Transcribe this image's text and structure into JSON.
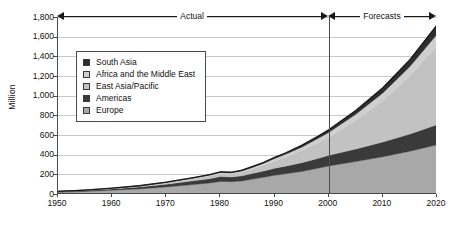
{
  "chart_data": {
    "type": "area",
    "stacked": true,
    "title": "",
    "xlabel": "",
    "ylabel": "Million",
    "xlim": [
      1950,
      2020
    ],
    "ylim": [
      0,
      1800
    ],
    "ytick_labels": [
      "0",
      "200",
      "400",
      "600",
      "800",
      "1,000",
      "1,200",
      "1,400",
      "1,600",
      "1,800"
    ],
    "ytick_values": [
      0,
      200,
      400,
      600,
      800,
      1000,
      1200,
      1400,
      1600,
      1800
    ],
    "xtick_labels": [
      "1950",
      "1960",
      "1970",
      "1980",
      "1990",
      "2000",
      "2010",
      "2020"
    ],
    "xtick_values": [
      1950,
      1960,
      1970,
      1980,
      1990,
      2000,
      2010,
      2020
    ],
    "grid": "horizontal",
    "legend_position": "upper-left-inside",
    "annotations": [
      {
        "label": "Actual",
        "from": 1950,
        "to": 2000,
        "style": "double-arrow"
      },
      {
        "label": "Forecasts",
        "from": 2000,
        "to": 2020,
        "style": "double-arrow"
      }
    ],
    "forecast_divider_x": 2000,
    "x": [
      1950,
      1955,
      1960,
      1965,
      1970,
      1975,
      1978,
      1980,
      1982,
      1984,
      1986,
      1988,
      1990,
      1992,
      1995,
      1998,
      2000,
      2005,
      2010,
      2015,
      2020
    ],
    "series": [
      {
        "name": "Europe",
        "color": "#a8a8a8",
        "values": [
          18,
          26,
          38,
          52,
          72,
          96,
          112,
          128,
          125,
          133,
          152,
          170,
          190,
          205,
          230,
          262,
          285,
          330,
          380,
          435,
          500
        ]
      },
      {
        "name": "Americas",
        "color": "#3a3a3a",
        "values": [
          7,
          10,
          14,
          20,
          28,
          38,
          44,
          50,
          48,
          52,
          58,
          64,
          72,
          78,
          88,
          100,
          108,
          128,
          150,
          175,
          205
        ]
      },
      {
        "name": "East Asia/Pacific",
        "color": "#c2c2c2",
        "values": [
          1,
          2,
          4,
          7,
          12,
          20,
          26,
          30,
          30,
          36,
          46,
          58,
          74,
          92,
          124,
          160,
          185,
          290,
          420,
          590,
          800
        ]
      },
      {
        "name": "Africa and the Middle East",
        "color": "#cfcfcf",
        "values": [
          1,
          1,
          2,
          3,
          5,
          8,
          10,
          12,
          12,
          14,
          17,
          20,
          24,
          28,
          34,
          42,
          48,
          62,
          78,
          96,
          118
        ]
      },
      {
        "name": "South Asia",
        "color": "#2e2e2e",
        "values": [
          0,
          1,
          1,
          2,
          3,
          4,
          5,
          6,
          6,
          7,
          8,
          10,
          12,
          14,
          18,
          23,
          27,
          38,
          52,
          70,
          95
        ]
      }
    ],
    "totals": [
      27,
      40,
      59,
      84,
      120,
      166,
      197,
      226,
      221,
      242,
      281,
      322,
      372,
      417,
      494,
      587,
      653,
      848,
      1080,
      1366,
      1718
    ]
  },
  "legend": {
    "items": [
      {
        "label": "South Asia",
        "swatch": "dark"
      },
      {
        "label": "Africa and the Middle East",
        "swatch": "light"
      },
      {
        "label": "East Asia/Pacific",
        "swatch": "light-2"
      },
      {
        "label": "Americas",
        "swatch": "darkest"
      },
      {
        "label": "Europe",
        "swatch": "medium"
      }
    ]
  },
  "colors": {
    "south_asia": "#2e2e2e",
    "africa_middle_east": "#cfcfcf",
    "east_asia_pacific": "#c2c2c2",
    "americas": "#3a3a3a",
    "europe": "#a8a8a8",
    "axis": "#4a4a4a",
    "grid": "#c9c9c9",
    "outline": "#1a1a1a"
  }
}
